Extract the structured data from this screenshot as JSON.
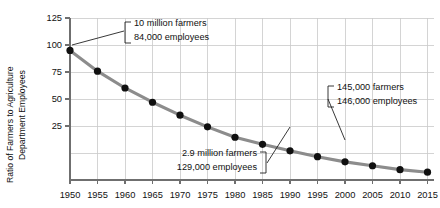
{
  "chart_data": {
    "type": "line",
    "title": "",
    "xlabel": "",
    "ylabel": "Ratio of Farmers to Agriculture Department Employees",
    "ylabel_line1": "Ratio of Farmers to Agriculture",
    "ylabel_line2": "Department Employees",
    "x": [
      1950,
      1955,
      1960,
      1965,
      1970,
      1975,
      1980,
      1985,
      1990,
      1995,
      2000,
      2005,
      2010,
      2015
    ],
    "values": [
      100,
      84,
      71,
      60,
      50,
      41,
      33,
      27.5,
      22.5,
      18,
      14,
      11,
      8,
      6
    ],
    "series": [
      {
        "name": "Ratio of Farmers to Agriculture Department Employees",
        "values": [
          100,
          84,
          71,
          60,
          50,
          41,
          33,
          27.5,
          22.5,
          18,
          14,
          11,
          8,
          6
        ]
      }
    ],
    "xlim": [
      1950,
      2015
    ],
    "ylim": [
      0,
      125
    ],
    "ytick_labels": [
      "25",
      "50",
      "75",
      "100",
      "125"
    ],
    "ytick_values": [
      25,
      50,
      75,
      100,
      125
    ],
    "xtick_labels": [
      "1950",
      "1955",
      "1960",
      "1965",
      "1970",
      "1975",
      "1980",
      "1985",
      "1990",
      "1995",
      "2000",
      "2005",
      "2010",
      "2015"
    ],
    "grid": true,
    "legend": "none",
    "line_color": "#8c8c8c",
    "marker_color": "#101010",
    "grid_color": "#c9c9c9",
    "annotations": [
      {
        "id": "annotation-1950",
        "line1": "10 million farmers",
        "line2": "84,000 employees",
        "points_to_year": 1950,
        "points_to_value": 100
      },
      {
        "id": "annotation-1980",
        "line1": "2.9 million farmers",
        "line2": "129,000 employees",
        "points_to_year": 1990,
        "points_to_value": 22.5
      },
      {
        "id": "annotation-2000",
        "line1": "145,000 farmers",
        "line2": "146,000 employees",
        "points_to_year": 2000,
        "points_to_value": 14
      }
    ]
  }
}
